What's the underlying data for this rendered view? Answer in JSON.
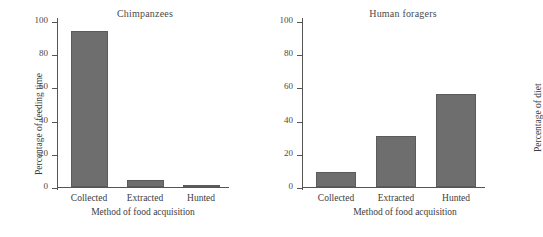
{
  "figure": {
    "width": 508,
    "height": 237,
    "background": "#ffffff",
    "bar_color": "#6e6e6e",
    "axis_color": "#555555",
    "text_color": "#3d3d3d"
  },
  "chart_data": [
    {
      "type": "bar",
      "title": "Chimpanzees",
      "categories": [
        "Collected",
        "Extracted",
        "Hunted"
      ],
      "values": [
        94,
        4,
        1.5
      ],
      "xlabel": "Method of food acquisition",
      "ylabel": "Percentage of feeding time",
      "ylim": [
        0,
        100
      ],
      "yticks": [
        0,
        20,
        40,
        60,
        80,
        100
      ],
      "ytick_labels": [
        "0",
        "20",
        "40",
        "60",
        "80",
        "100"
      ],
      "grid": false,
      "legend": false
    },
    {
      "type": "bar",
      "title": "Human foragers",
      "categories": [
        "Collected",
        "Extracted",
        "Hunted"
      ],
      "values": [
        9,
        31,
        56
      ],
      "xlabel": "Method of food acquisition",
      "ylabel": "Percentage of diet",
      "ylim": [
        0,
        100
      ],
      "yticks": [
        0,
        20,
        40,
        60,
        80,
        100
      ],
      "ytick_labels": [
        "0",
        "20",
        "40",
        "60",
        "80",
        "100"
      ],
      "grid": false,
      "legend": false
    }
  ]
}
